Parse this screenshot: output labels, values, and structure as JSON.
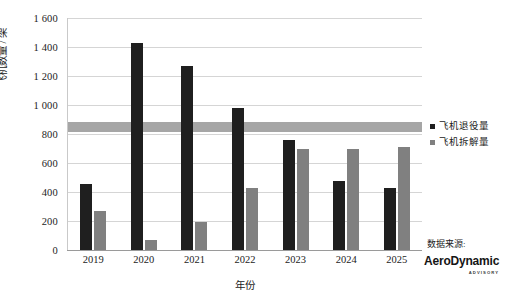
{
  "chart_data": {
    "type": "bar",
    "title": "",
    "xlabel": "年份",
    "ylabel": "飞机数量 / 架",
    "categories": [
      "2019",
      "2020",
      "2021",
      "2022",
      "2023",
      "2024",
      "2025"
    ],
    "series": [
      {
        "name": "飞机退役量",
        "color": "#1f1f1f",
        "values": [
          455,
          1430,
          1270,
          980,
          760,
          475,
          425
        ]
      },
      {
        "name": "飞机拆解量",
        "color": "#808080",
        "values": [
          270,
          70,
          195,
          425,
          700,
          695,
          710
        ]
      }
    ],
    "ylim": [
      0,
      1600
    ],
    "ytick_values": [
      0,
      200,
      400,
      600,
      800,
      1000,
      1200,
      1400,
      1600
    ],
    "ytick_labels": [
      "0",
      "200",
      "400",
      "600",
      "800",
      "1 000",
      "1 200",
      "1 400",
      "1 600"
    ],
    "grid": true,
    "legend_position": "right",
    "annotations": [
      {
        "kind": "horizontal-band",
        "name": "reference-band",
        "value": 850,
        "thickness": 70,
        "color": "#a6a6a6"
      }
    ]
  },
  "legend": {
    "items": [
      {
        "label": "飞机退役量",
        "color": "#1f1f1f"
      },
      {
        "label": "飞机拆解量",
        "color": "#808080"
      }
    ]
  },
  "source": {
    "label": "数据来源:",
    "logo_main_a": "Aero",
    "logo_main_b": "Dynamic",
    "logo_sub": "ADVISORY"
  }
}
